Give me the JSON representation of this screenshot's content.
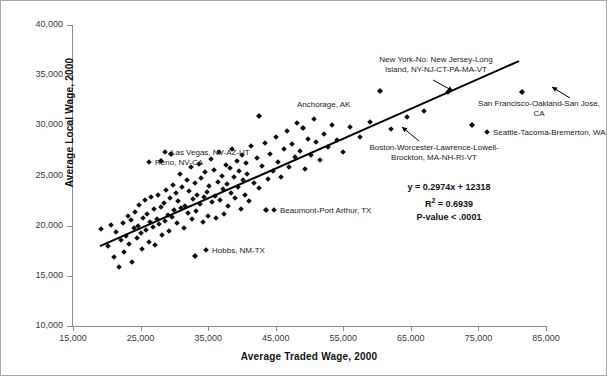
{
  "chart_data": {
    "type": "scatter",
    "title": "",
    "xlabel": "Average Traded Wage, 2000",
    "ylabel": "Average Local Wage, 2000",
    "xlim": [
      15000,
      85000
    ],
    "ylim": [
      10000,
      40000
    ],
    "xticks": [
      "15,000",
      "25,000",
      "35,000",
      "45,000",
      "55,000",
      "65,000",
      "75,000",
      "85,000"
    ],
    "xtick_values": [
      15000,
      25000,
      35000,
      45000,
      55000,
      65000,
      75000,
      85000
    ],
    "yticks": [
      "10,000",
      "15,000",
      "20,000",
      "25,000",
      "30,000",
      "35,000",
      "40,000"
    ],
    "ytick_values": [
      10000,
      15000,
      20000,
      25000,
      30000,
      35000,
      40000
    ],
    "grid": false,
    "legend": "none",
    "marker": "diamond",
    "marker_color": "#111111",
    "trendline": {
      "type": "linear",
      "slope": 0.2974,
      "intercept": 12318,
      "color": "#000000",
      "x_start": 19000,
      "x_end": 81000
    },
    "statistics": {
      "equation": "y = 0.2974x + 12318",
      "r_squared_label": "R",
      "r_squared_exponent": "2",
      "r_squared_value": "= 0.6939",
      "p_value": "P-value < .0001"
    },
    "annotations": [
      {
        "id": "new-york",
        "text_lines": [
          "New York-No. New Jersey-Long",
          "Island, NY-NJ-CT-PA-MA-VT"
        ],
        "has_arrow": true,
        "marker_inline": false,
        "point": {
          "x": 60500,
          "y": 33400
        }
      },
      {
        "id": "san-francisco",
        "text_lines": [
          "San Francisco-Oakland-San Jose,",
          "CA"
        ],
        "has_arrow": true,
        "marker_inline": false,
        "point": {
          "x": 81500,
          "y": 33300
        }
      },
      {
        "id": "seattle",
        "text_lines": [
          "Seattle-Tacoma-Bremerton, WA"
        ],
        "has_arrow": false,
        "marker_inline": true,
        "point": {
          "x": 74000,
          "y": 30000
        }
      },
      {
        "id": "boston",
        "text_lines": [
          "Boston-Worcester-Lawrence-Lowell-",
          "Brockton, MA-NH-RI-VT"
        ],
        "has_arrow": true,
        "marker_inline": false,
        "point": {
          "x": 49000,
          "y": 29700
        }
      },
      {
        "id": "anchorage",
        "text_lines": [
          "Anchorage, AK"
        ],
        "has_arrow": false,
        "marker_inline": false,
        "point": {
          "x": 42500,
          "y": 30900
        }
      },
      {
        "id": "las-vegas",
        "text_lines": [
          "Las Vegas, NV-AZ-UT"
        ],
        "has_arrow": false,
        "marker_inline": true,
        "point": {
          "x": 29500,
          "y": 27100
        }
      },
      {
        "id": "reno",
        "text_lines": [
          "Reno, NV-CA"
        ],
        "has_arrow": false,
        "marker_inline": true,
        "point": {
          "x": 28000,
          "y": 26400
        }
      },
      {
        "id": "beaumont",
        "text_lines": [
          "Beaumont-Port Arthur, TX"
        ],
        "has_arrow": false,
        "marker_inline": true,
        "point": {
          "x": 43500,
          "y": 21600
        }
      },
      {
        "id": "hobbs",
        "text_lines": [
          "Hobbs, NM-TX"
        ],
        "has_arrow": false,
        "marker_inline": true,
        "point": {
          "x": 33000,
          "y": 17000
        }
      }
    ],
    "points": [
      [
        19200,
        19700
      ],
      [
        20200,
        18000
      ],
      [
        20600,
        20100
      ],
      [
        21000,
        16900
      ],
      [
        21400,
        19400
      ],
      [
        21800,
        15900
      ],
      [
        22100,
        18600
      ],
      [
        22400,
        20300
      ],
      [
        22600,
        17400
      ],
      [
        22900,
        19000
      ],
      [
        23100,
        21000
      ],
      [
        23300,
        18200
      ],
      [
        23600,
        20600
      ],
      [
        23800,
        16400
      ],
      [
        24000,
        19800
      ],
      [
        24200,
        21400
      ],
      [
        24400,
        18800
      ],
      [
        24600,
        20000
      ],
      [
        24800,
        22100
      ],
      [
        25000,
        19300
      ],
      [
        25200,
        17700
      ],
      [
        25400,
        20800
      ],
      [
        25600,
        22600
      ],
      [
        25800,
        19600
      ],
      [
        26000,
        21200
      ],
      [
        26200,
        18400
      ],
      [
        26400,
        20400
      ],
      [
        26600,
        22900
      ],
      [
        26800,
        19900
      ],
      [
        27000,
        21700
      ],
      [
        27200,
        18100
      ],
      [
        27400,
        20700
      ],
      [
        27600,
        23100
      ],
      [
        27800,
        20200
      ],
      [
        28000,
        21900
      ],
      [
        28000,
        26400
      ],
      [
        28200,
        19100
      ],
      [
        28400,
        22300
      ],
      [
        28600,
        20500
      ],
      [
        28800,
        23600
      ],
      [
        29000,
        21100
      ],
      [
        29200,
        19500
      ],
      [
        29400,
        22800
      ],
      [
        29500,
        27100
      ],
      [
        29600,
        20900
      ],
      [
        29800,
        24100
      ],
      [
        30000,
        21600
      ],
      [
        30200,
        23300
      ],
      [
        30400,
        20300
      ],
      [
        30600,
        22500
      ],
      [
        30800,
        25100
      ],
      [
        31000,
        21800
      ],
      [
        31200,
        23900
      ],
      [
        31400,
        19800
      ],
      [
        31600,
        22000
      ],
      [
        31800,
        24600
      ],
      [
        32000,
        21300
      ],
      [
        32200,
        23500
      ],
      [
        32400,
        25800
      ],
      [
        32600,
        20700
      ],
      [
        32800,
        22700
      ],
      [
        33000,
        17000
      ],
      [
        33000,
        24300
      ],
      [
        33200,
        21500
      ],
      [
        33400,
        23100
      ],
      [
        33600,
        26100
      ],
      [
        33800,
        22200
      ],
      [
        34000,
        24800
      ],
      [
        34200,
        20400
      ],
      [
        34400,
        22900
      ],
      [
        34600,
        25300
      ],
      [
        34800,
        23400
      ],
      [
        35000,
        21000
      ],
      [
        35200,
        24000
      ],
      [
        35400,
        26600
      ],
      [
        35600,
        22400
      ],
      [
        35800,
        25500
      ],
      [
        36000,
        23000
      ],
      [
        36200,
        20800
      ],
      [
        36400,
        24400
      ],
      [
        36600,
        27300
      ],
      [
        36800,
        22600
      ],
      [
        37000,
        25000
      ],
      [
        37200,
        23700
      ],
      [
        37400,
        21200
      ],
      [
        37600,
        26000
      ],
      [
        37800,
        24200
      ],
      [
        38000,
        22000
      ],
      [
        38200,
        25700
      ],
      [
        38400,
        23300
      ],
      [
        38600,
        27600
      ],
      [
        38800,
        24900
      ],
      [
        39000,
        22800
      ],
      [
        39200,
        26400
      ],
      [
        39400,
        23900
      ],
      [
        39600,
        25400
      ],
      [
        39800,
        21700
      ],
      [
        40000,
        27000
      ],
      [
        40200,
        24600
      ],
      [
        40400,
        23100
      ],
      [
        40600,
        26200
      ],
      [
        40800,
        25100
      ],
      [
        41000,
        22500
      ],
      [
        41400,
        27900
      ],
      [
        41800,
        24300
      ],
      [
        42200,
        26700
      ],
      [
        42500,
        30900
      ],
      [
        42600,
        23800
      ],
      [
        43000,
        25900
      ],
      [
        43400,
        28200
      ],
      [
        43500,
        21600
      ],
      [
        43800,
        24700
      ],
      [
        44200,
        27100
      ],
      [
        44600,
        25400
      ],
      [
        45000,
        28800
      ],
      [
        45400,
        26300
      ],
      [
        45800,
        24900
      ],
      [
        46200,
        27600
      ],
      [
        46600,
        29400
      ],
      [
        47000,
        25800
      ],
      [
        47400,
        28100
      ],
      [
        47800,
        26800
      ],
      [
        48200,
        30200
      ],
      [
        48600,
        27400
      ],
      [
        49000,
        29700
      ],
      [
        49400,
        25600
      ],
      [
        49800,
        28600
      ],
      [
        50200,
        27000
      ],
      [
        50600,
        30600
      ],
      [
        51000,
        28300
      ],
      [
        51600,
        26500
      ],
      [
        52200,
        29100
      ],
      [
        52800,
        27800
      ],
      [
        53400,
        30000
      ],
      [
        54000,
        28500
      ],
      [
        55000,
        27300
      ],
      [
        56000,
        29800
      ],
      [
        57500,
        28800
      ],
      [
        59000,
        30300
      ],
      [
        60500,
        33400
      ],
      [
        62000,
        29600
      ],
      [
        64500,
        30800
      ],
      [
        67000,
        31400
      ],
      [
        70500,
        33300
      ],
      [
        74000,
        30000
      ],
      [
        81500,
        33300
      ]
    ]
  }
}
